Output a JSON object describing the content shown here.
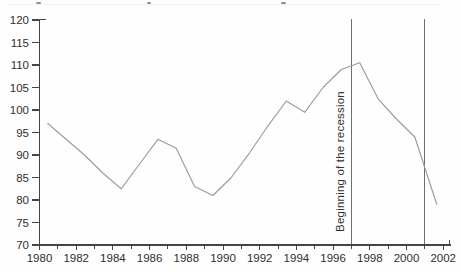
{
  "chart_data": {
    "type": "line",
    "title": "",
    "xlabel": "",
    "ylabel": "",
    "x_ticks_labeled": [
      1980,
      1982,
      1984,
      1986,
      1988,
      1990,
      1992,
      1994,
      1996,
      1998,
      2000,
      2002
    ],
    "x_minor_tick_step": 1,
    "x_range": [
      1980,
      2002.4
    ],
    "y_ticks": [
      70,
      75,
      80,
      85,
      90,
      95,
      100,
      105,
      110,
      115,
      120
    ],
    "ylim": [
      70,
      120
    ],
    "grid": false,
    "legend": "none",
    "series": [
      {
        "name": "index-line",
        "color": "#9c9c9c",
        "points": [
          [
            1980,
            97
          ],
          [
            1981,
            93.5
          ],
          [
            1982,
            90
          ],
          [
            1983,
            86
          ],
          [
            1984,
            82.5
          ],
          [
            1985,
            88
          ],
          [
            1986,
            93.5
          ],
          [
            1987,
            91.5
          ],
          [
            1988,
            83
          ],
          [
            1989,
            81
          ],
          [
            1990,
            85
          ],
          [
            1991,
            90.5
          ],
          [
            1992,
            96.5
          ],
          [
            1993,
            102
          ],
          [
            1994,
            99.5
          ],
          [
            1995,
            105
          ],
          [
            1996,
            109
          ],
          [
            1997,
            110.5
          ],
          [
            1998,
            102.5
          ],
          [
            1999,
            98
          ],
          [
            2000,
            94
          ],
          [
            2001.2,
            79
          ]
        ]
      }
    ],
    "annotations": {
      "vlines": [
        {
          "year": 1997,
          "label": "Beginning of the recession"
        },
        {
          "year": 2001,
          "label": ""
        }
      ]
    },
    "layout": {
      "points_plotted_at_mid_year": true,
      "vline_span": "full-plot-height"
    }
  },
  "colors": {
    "axis": "#454545",
    "tick_label": "#2e2e2e",
    "line": "#9c9c9c",
    "vline": "#6f6f6f",
    "annotation_text": "#333333"
  }
}
